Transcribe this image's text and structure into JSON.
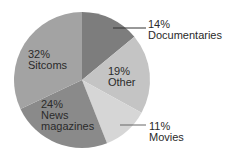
{
  "chart_data": {
    "type": "pie",
    "title": "",
    "categories": [
      "Documentaries",
      "Other",
      "Movies",
      "News magazines",
      "Sitcoms"
    ],
    "values": [
      14,
      19,
      11,
      24,
      32
    ],
    "unit": "%",
    "start_angle": "12 o'clock, clockwise",
    "colors": [
      "#7d7d7d",
      "#c4c4c4",
      "#d6d6d6",
      "#8a8a8a",
      "#a3a3a3"
    ],
    "labels": [
      {
        "pct": "14%",
        "name": "Documentaries",
        "position": "outside-right-top",
        "leader_line": true
      },
      {
        "pct": "19%",
        "name": "Other",
        "position": "inside"
      },
      {
        "pct": "11%",
        "name": "Movies",
        "position": "outside-right-bottom",
        "leader_line": true
      },
      {
        "pct": "24%",
        "name": "News",
        "name2": "magazines",
        "position": "inside"
      },
      {
        "pct": "32%",
        "name": "Sitcoms",
        "position": "inside"
      }
    ]
  }
}
